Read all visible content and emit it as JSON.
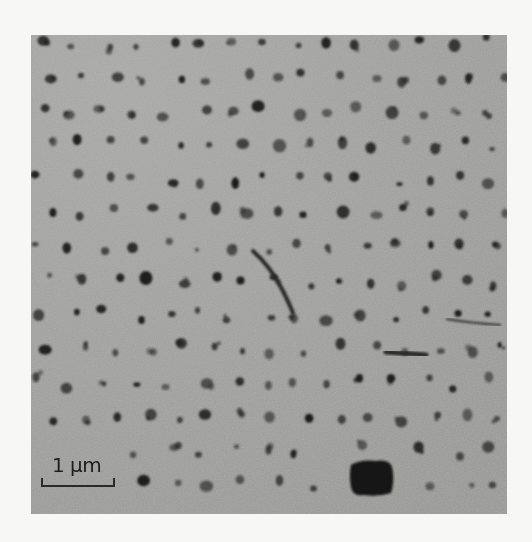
{
  "figure": {
    "type": "transmission electron micrograph",
    "colors": {
      "page_background": "#f7f7f5",
      "image_background": "#9c9c9a",
      "particle": "#1c1c1c",
      "scale_bar": "#2a2a2a"
    },
    "scale_bar": {
      "label": "1 µm",
      "length_px": 74
    },
    "features": [
      {
        "name": "diagonal-streak",
        "approx_bounds": [
          250,
          250,
          290,
          310
        ]
      },
      {
        "name": "horizontal-streak",
        "approx_bounds": [
          385,
          345,
          430,
          355
        ]
      },
      {
        "name": "large-blob",
        "approx_bounds": [
          350,
          455,
          392,
          495
        ]
      }
    ]
  }
}
